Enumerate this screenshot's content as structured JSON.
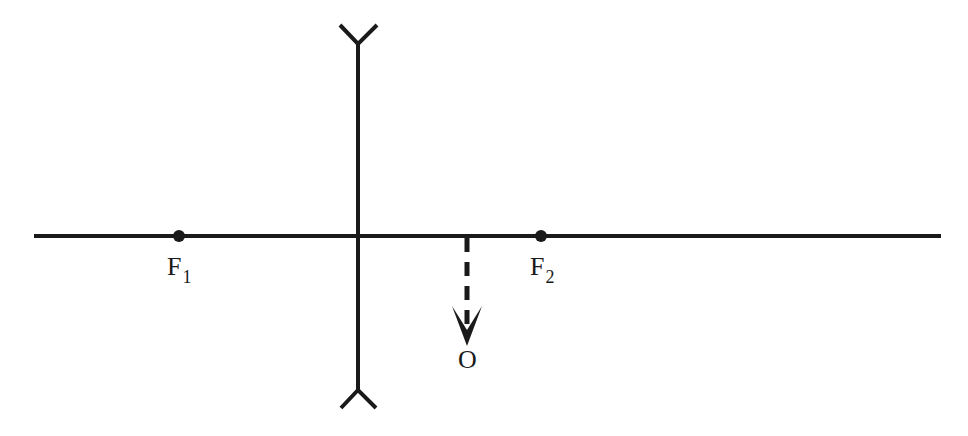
{
  "diagram": {
    "type": "optics-ray-diagram",
    "colors": {
      "stroke": "#1a1a1a",
      "background": "#ffffff"
    },
    "principal_axis": {
      "x1": 34,
      "x2": 941,
      "y": 236
    },
    "lens": {
      "type": "diverging",
      "x": 358,
      "top": 44,
      "bottom": 390
    },
    "focal_points": [
      {
        "id": "F1",
        "label": "F",
        "subscript": "1",
        "x": 179,
        "y": 236
      },
      {
        "id": "F2",
        "label": "F",
        "subscript": "2",
        "x": 541,
        "y": 236
      }
    ],
    "object": {
      "label": "O",
      "x": 467,
      "from_y": 236,
      "to_y": 346,
      "style": "dashed",
      "direction": "down"
    }
  }
}
